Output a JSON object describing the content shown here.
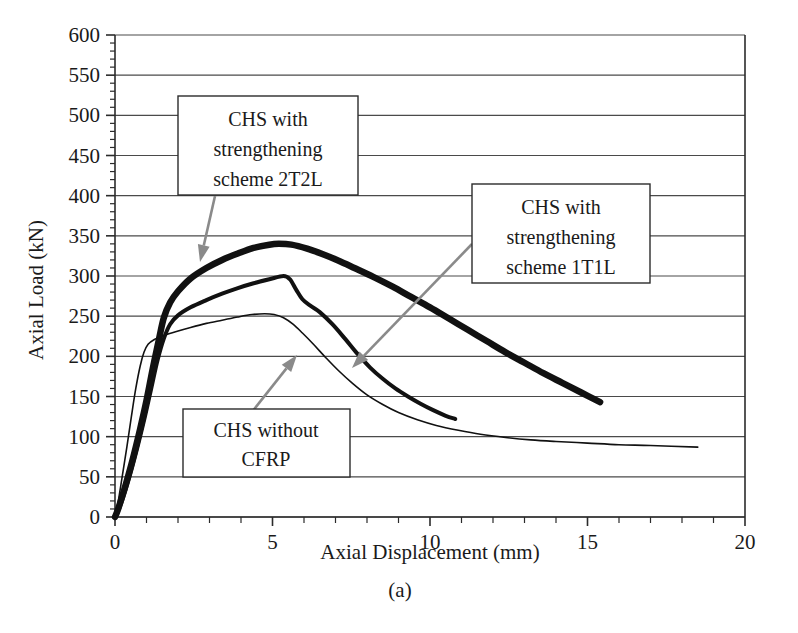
{
  "figure": {
    "caption": "(a)",
    "xlabel": "Axial Displacement (mm)",
    "ylabel": "Axial Load (kN)"
  },
  "annotations": {
    "a1_line1": "CHS with",
    "a1_line2": "strengthening",
    "a1_line3": "scheme 2T2L",
    "a2_line1": "CHS with",
    "a2_line2": "strengthening",
    "a2_line3": "scheme 1T1L",
    "a3_line1": "CHS without",
    "a3_line2": "CFRP"
  },
  "axis": {
    "x_ticks": [
      "0",
      "5",
      "10",
      "15",
      "20"
    ],
    "y_ticks": [
      "600",
      "550",
      "500",
      "450",
      "400",
      "350",
      "300",
      "250",
      "200",
      "150",
      "100",
      "50",
      "0"
    ]
  },
  "chart_data": {
    "type": "line",
    "title": "",
    "xlabel": "Axial Displacement (mm)",
    "ylabel": "Axial Load (kN)",
    "xlim": [
      0,
      20
    ],
    "ylim": [
      0,
      600
    ],
    "xtick_step": 5,
    "ytick_step": 50,
    "x_minor_step": 1,
    "y_minor_step": 10,
    "grid": "horizontal",
    "legend": "none",
    "annotation_labels": [
      "CHS with strengthening scheme 2T2L",
      "CHS with strengthening scheme 1T1L",
      "CHS without CFRP"
    ],
    "series": [
      {
        "name": "CHS with strengthening scheme 2T2L",
        "style": "thick",
        "peak": {
          "x": 5.0,
          "y": 340
        },
        "points": [
          [
            0.0,
            0
          ],
          [
            0.1,
            10
          ],
          [
            0.3,
            35
          ],
          [
            0.55,
            70
          ],
          [
            0.8,
            110
          ],
          [
            1.0,
            145
          ],
          [
            1.2,
            185
          ],
          [
            1.4,
            222
          ],
          [
            1.55,
            248
          ],
          [
            1.75,
            267
          ],
          [
            2.0,
            281
          ],
          [
            2.4,
            297
          ],
          [
            2.9,
            310
          ],
          [
            3.4,
            320
          ],
          [
            3.9,
            328
          ],
          [
            4.4,
            335
          ],
          [
            4.9,
            339
          ],
          [
            5.2,
            340
          ],
          [
            5.6,
            339
          ],
          [
            6.1,
            334
          ],
          [
            6.6,
            327
          ],
          [
            7.1,
            319
          ],
          [
            7.6,
            310
          ],
          [
            8.2,
            299
          ],
          [
            8.8,
            287
          ],
          [
            9.4,
            274
          ],
          [
            10.0,
            261
          ],
          [
            10.6,
            247
          ],
          [
            11.2,
            233
          ],
          [
            11.8,
            219
          ],
          [
            12.4,
            205
          ],
          [
            13.0,
            192
          ],
          [
            13.6,
            179
          ],
          [
            14.2,
            167
          ],
          [
            14.8,
            155
          ],
          [
            15.4,
            143
          ]
        ]
      },
      {
        "name": "CHS with strengthening scheme 1T1L",
        "style": "medium",
        "peak": {
          "x": 5.35,
          "y": 300
        },
        "points": [
          [
            0.0,
            0
          ],
          [
            0.15,
            12
          ],
          [
            0.4,
            42
          ],
          [
            0.7,
            85
          ],
          [
            0.95,
            125
          ],
          [
            1.15,
            160
          ],
          [
            1.35,
            195
          ],
          [
            1.55,
            222
          ],
          [
            1.75,
            240
          ],
          [
            2.0,
            251
          ],
          [
            2.4,
            261
          ],
          [
            2.9,
            270
          ],
          [
            3.4,
            278
          ],
          [
            3.9,
            285
          ],
          [
            4.4,
            291
          ],
          [
            4.9,
            296
          ],
          [
            5.35,
            300
          ],
          [
            5.55,
            296
          ],
          [
            5.75,
            283
          ],
          [
            5.95,
            271
          ],
          [
            6.2,
            263
          ],
          [
            6.5,
            255
          ],
          [
            6.9,
            240
          ],
          [
            7.3,
            222
          ],
          [
            7.7,
            203
          ],
          [
            8.1,
            186
          ],
          [
            8.5,
            172
          ],
          [
            8.9,
            160
          ],
          [
            9.3,
            150
          ],
          [
            9.7,
            141
          ],
          [
            10.1,
            133
          ],
          [
            10.5,
            126
          ],
          [
            10.8,
            122
          ]
        ]
      },
      {
        "name": "CHS without CFRP",
        "style": "thin",
        "peak": {
          "x": 4.75,
          "y": 253
        },
        "points": [
          [
            0.0,
            0
          ],
          [
            0.08,
            14
          ],
          [
            0.22,
            48
          ],
          [
            0.38,
            88
          ],
          [
            0.52,
            125
          ],
          [
            0.66,
            160
          ],
          [
            0.8,
            188
          ],
          [
            0.92,
            205
          ],
          [
            1.05,
            215
          ],
          [
            1.25,
            221
          ],
          [
            1.55,
            226
          ],
          [
            1.95,
            231
          ],
          [
            2.4,
            236
          ],
          [
            2.9,
            241
          ],
          [
            3.4,
            245
          ],
          [
            3.9,
            249
          ],
          [
            4.35,
            252
          ],
          [
            4.75,
            253
          ],
          [
            5.05,
            252
          ],
          [
            5.35,
            248
          ],
          [
            5.65,
            240
          ],
          [
            5.95,
            229
          ],
          [
            6.3,
            215
          ],
          [
            6.7,
            198
          ],
          [
            7.1,
            182
          ],
          [
            7.55,
            166
          ],
          [
            8.0,
            152
          ],
          [
            8.5,
            140
          ],
          [
            9.0,
            130
          ],
          [
            9.6,
            121
          ],
          [
            10.2,
            114
          ],
          [
            10.9,
            108
          ],
          [
            11.6,
            103
          ],
          [
            12.4,
            99
          ],
          [
            13.2,
            96
          ],
          [
            14.0,
            94
          ],
          [
            15.0,
            92
          ],
          [
            16.0,
            90
          ],
          [
            17.0,
            89
          ],
          [
            18.5,
            87
          ]
        ]
      }
    ]
  }
}
